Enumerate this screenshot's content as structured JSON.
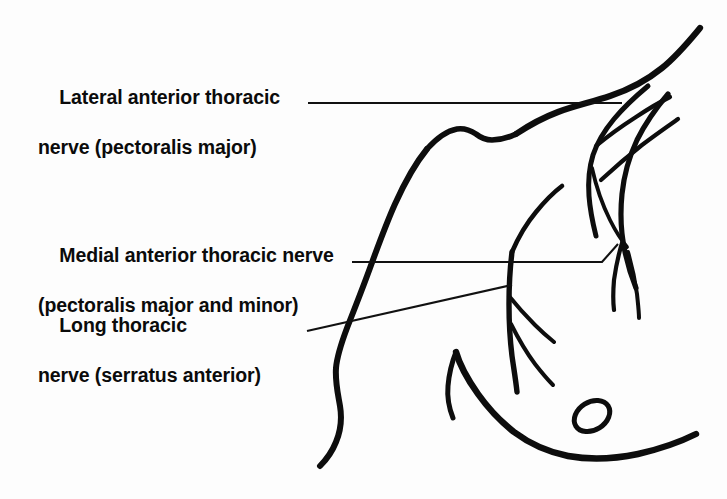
{
  "figure": {
    "background_color": "#fdfdfd",
    "ink_color": "#0d0d0d",
    "width": 727,
    "height": 499
  },
  "labels": [
    {
      "id": "lateral-anterior-thoracic",
      "line1": "Lateral anterior thoracic",
      "line2": "nerve (pectoralis major)",
      "leader": "horizontal",
      "target": "lateral pectoral nerve at clavicle level"
    },
    {
      "id": "medial-anterior-thoracic",
      "line1": "Medial anterior thoracic nerve",
      "line2": "(pectoralis major and minor)",
      "leader": "horizontal-with-hook",
      "target": "medial pectoral nerve in axilla"
    },
    {
      "id": "long-thoracic",
      "line1": "Long thoracic",
      "line2": "nerve (serratus anterior)",
      "leader": "diagonal",
      "target": "long thoracic nerve on serratus anterior"
    }
  ],
  "anatomy": {
    "parts": [
      "shoulder-and-arm-contour",
      "clavicle-ridge",
      "torso-front-contour",
      "breast-contour",
      "nipple-areola",
      "lateral-pectoral-nerve",
      "medial-pectoral-nerve",
      "long-thoracic-nerve",
      "nerve-branches"
    ],
    "nipple_shape": "oval-outline"
  }
}
